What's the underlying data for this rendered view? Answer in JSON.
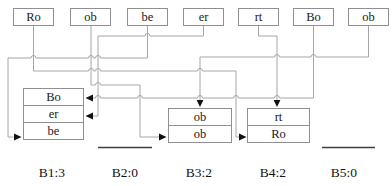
{
  "diagram": {
    "top_row": [
      {
        "label": "Ro"
      },
      {
        "label": "ob"
      },
      {
        "label": "be"
      },
      {
        "label": "er"
      },
      {
        "label": "rt"
      },
      {
        "label": "Bo"
      },
      {
        "label": "ob"
      }
    ],
    "buckets": [
      {
        "label": "B1:3",
        "count": 3,
        "slots": {
          "s0": "Bo",
          "s1": "er",
          "s2": "be"
        }
      },
      {
        "label": "B2:0",
        "count": 0,
        "slots": {}
      },
      {
        "label": "B3:2",
        "count": 2,
        "slots": {
          "s0": "ob",
          "s1": "ob"
        }
      },
      {
        "label": "B4:2",
        "count": 2,
        "slots": {
          "s0": "rt",
          "s1": "Ro"
        }
      },
      {
        "label": "B5:0",
        "count": 0,
        "slots": {}
      }
    ],
    "connections": [
      {
        "from": "Ro",
        "to_bucket": "B4",
        "to_slot": "Ro",
        "arrow": "left-side"
      },
      {
        "from": "ob",
        "to_bucket": "B3",
        "to_slot": "ob (bottom)",
        "arrow": "left-side"
      },
      {
        "from": "be",
        "to_bucket": "B1",
        "to_slot": "be",
        "arrow": "left-side"
      },
      {
        "from": "er",
        "to_bucket": "B1",
        "to_slot": "er",
        "arrow": "right-side"
      },
      {
        "from": "rt",
        "to_bucket": "B4",
        "to_slot": "rt",
        "arrow": "top"
      },
      {
        "from": "Bo",
        "to_bucket": "B1",
        "to_slot": "Bo",
        "arrow": "right-side"
      },
      {
        "from": "ob",
        "to_bucket": "B3",
        "to_slot": "ob (top)",
        "arrow": "top"
      }
    ],
    "colors": {
      "wire": "#a6a6a6",
      "box_border": "#8f8f8f",
      "text": "#1a1a1a",
      "arrowhead": "#111111",
      "empty_bucket_line": "#3d3d3d",
      "background": "#ffffff"
    }
  }
}
